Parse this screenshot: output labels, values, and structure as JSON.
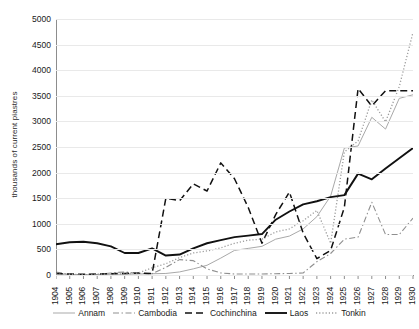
{
  "chart_data": {
    "type": "line",
    "title": "",
    "xlabel": "",
    "ylabel": "thousands of current piastres",
    "ylim": [
      0,
      5000
    ],
    "ytick_values": [
      0,
      500,
      1000,
      1500,
      2000,
      2500,
      3000,
      3500,
      4000,
      4500,
      5000
    ],
    "ytick_labels": [
      "0",
      "500",
      "1000",
      "1500",
      "2000",
      "2500",
      "3000",
      "3500",
      "4000",
      "4500",
      "5000"
    ],
    "grid": true,
    "legend_position": "bottom",
    "categories": [
      "1904",
      "1905",
      "1906",
      "1907",
      "1908",
      "1909",
      "1910",
      "1911",
      "1912",
      "1913",
      "1914",
      "1915",
      "1916",
      "1917",
      "1918",
      "1919",
      "1920",
      "1921",
      "1922",
      "1923",
      "1924",
      "1925",
      "1926",
      "1927",
      "1928",
      "1929",
      "1930"
    ],
    "series": [
      {
        "name": "Annam",
        "style": "solid-thin",
        "color": "#a9a9a9",
        "values": [
          20,
          10,
          8,
          10,
          12,
          15,
          20,
          25,
          30,
          60,
          120,
          190,
          330,
          480,
          520,
          560,
          700,
          760,
          900,
          1140,
          1540,
          2480,
          2520,
          3080,
          2850,
          3450,
          3520
        ]
      },
      {
        "name": "Cambodia",
        "style": "dash-dot",
        "color": "#8f8f8f",
        "values": [
          60,
          10,
          8,
          10,
          40,
          60,
          30,
          25,
          150,
          300,
          280,
          120,
          40,
          20,
          20,
          20,
          25,
          30,
          40,
          260,
          420,
          700,
          740,
          1420,
          790,
          790,
          1110
        ]
      },
      {
        "name": "Cochinchina",
        "style": "dash-long",
        "color": "#111111",
        "values": [
          30,
          20,
          15,
          20,
          25,
          30,
          40,
          30,
          1500,
          1450,
          1780,
          1640,
          2190,
          1880,
          1320,
          620,
          1180,
          1620,
          820,
          320,
          480,
          1320,
          3640,
          3300,
          3600,
          3600,
          3600
        ]
      },
      {
        "name": "Laos",
        "style": "solid-thick",
        "color": "#111111",
        "values": [
          600,
          640,
          650,
          620,
          560,
          430,
          430,
          520,
          380,
          400,
          520,
          620,
          680,
          740,
          770,
          800,
          1080,
          1240,
          1380,
          1440,
          1520,
          1560,
          1980,
          1870,
          2080,
          2280,
          2480
        ]
      },
      {
        "name": "Tonkin",
        "style": "dotted",
        "color": "#9c9c9c",
        "values": [
          20,
          15,
          12,
          15,
          18,
          20,
          40,
          140,
          220,
          340,
          430,
          470,
          530,
          620,
          680,
          700,
          840,
          900,
          1060,
          1260,
          620,
          2400,
          2620,
          3420,
          2990,
          3680,
          4740
        ]
      }
    ]
  },
  "axis": {
    "y_title": "thousands of current piastres"
  },
  "legend": {
    "items": [
      {
        "label": "Annam"
      },
      {
        "label": "Cambodia"
      },
      {
        "label": "Cochinchina"
      },
      {
        "label": "Laos"
      },
      {
        "label": "Tonkin"
      }
    ]
  }
}
